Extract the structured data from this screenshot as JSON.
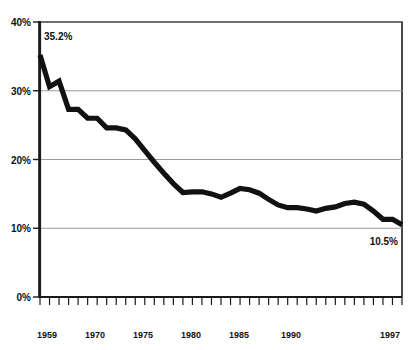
{
  "chart_data": {
    "type": "line",
    "title": "",
    "subtitle": "",
    "xlabel": "",
    "ylabel": "",
    "xlim": [
      1959,
      1997
    ],
    "ylim": [
      0,
      40
    ],
    "grid": true,
    "legend": "none",
    "y_ticks": [
      "0%",
      "10%",
      "20%",
      "30%",
      "40%"
    ],
    "y_tick_values": [
      0,
      10,
      20,
      30,
      40
    ],
    "x_ticks": [
      "1959",
      "1970",
      "1975",
      "1980",
      "1985",
      "1990",
      "1997"
    ],
    "x_tick_values": [
      1959,
      1970,
      1975,
      1980,
      1985,
      1990,
      1997
    ],
    "x_minor_tick_interval": 1,
    "line_color": "#111111",
    "gridline_color": "#9a9a9a",
    "annotations": [
      {
        "text": "35.2%",
        "x": 1960,
        "y": 37.8
      },
      {
        "text": "10.5%",
        "x": 1995,
        "y": 8.2
      }
    ],
    "series": [
      {
        "name": "Rate",
        "x": [
          1959,
          1960,
          1961,
          1962,
          1963,
          1964,
          1965,
          1966,
          1967,
          1968,
          1969,
          1970,
          1971,
          1972,
          1973,
          1974,
          1975,
          1976,
          1977,
          1978,
          1979,
          1980,
          1981,
          1982,
          1983,
          1984,
          1985,
          1986,
          1987,
          1988,
          1989,
          1990,
          1991,
          1992,
          1993,
          1994,
          1995,
          1996,
          1997
        ],
        "values": [
          35.2,
          30.6,
          31.4,
          27.3,
          27.3,
          26.0,
          26.0,
          24.6,
          24.6,
          24.3,
          23.0,
          21.3,
          19.6,
          18.0,
          16.5,
          15.2,
          15.3,
          15.3,
          15.0,
          14.5,
          15.1,
          15.8,
          15.6,
          15.1,
          14.2,
          13.4,
          13.0,
          13.0,
          12.8,
          12.5,
          12.9,
          13.1,
          13.6,
          13.8,
          13.5,
          12.5,
          11.3,
          11.3,
          10.5
        ]
      }
    ]
  },
  "axes": {
    "y_label_0": "0%",
    "y_label_1": "10%",
    "y_label_2": "20%",
    "y_label_3": "30%",
    "y_label_4": "40%",
    "x_label_0": "1959",
    "x_label_1": "1970",
    "x_label_2": "1975",
    "x_label_3": "1980",
    "x_label_4": "1985",
    "x_label_5": "1990",
    "x_label_6": "1997"
  },
  "annotations": {
    "start_value": "35.2%",
    "end_value": "10.5%"
  }
}
